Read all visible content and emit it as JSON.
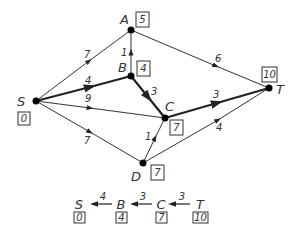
{
  "diagram": {
    "title": "",
    "colors": {
      "line": "#333333",
      "node": "#000000",
      "background": "#ffffff"
    },
    "nodes": [
      {
        "id": "S",
        "label": "S",
        "value": "0"
      },
      {
        "id": "A",
        "label": "A",
        "value": "5"
      },
      {
        "id": "B",
        "label": "B",
        "value": "4"
      },
      {
        "id": "C",
        "label": "C",
        "value": "7"
      },
      {
        "id": "D",
        "label": "D",
        "value": "7"
      },
      {
        "id": "T",
        "label": "T",
        "value": "10"
      }
    ],
    "edges": [
      {
        "from": "S",
        "to": "A",
        "weight": "7",
        "bold": false
      },
      {
        "from": "S",
        "to": "B",
        "weight": "4",
        "bold": true
      },
      {
        "from": "S",
        "to": "C",
        "weight": "9",
        "bold": false
      },
      {
        "from": "S",
        "to": "D",
        "weight": "7",
        "bold": false
      },
      {
        "from": "B",
        "to": "A",
        "weight": "1",
        "bold": false
      },
      {
        "from": "B",
        "to": "C",
        "weight": "3",
        "bold": true
      },
      {
        "from": "A",
        "to": "T",
        "weight": "6",
        "bold": false
      },
      {
        "from": "C",
        "to": "T",
        "weight": "3",
        "bold": true
      },
      {
        "from": "D",
        "to": "C",
        "weight": "1",
        "bold": false
      },
      {
        "from": "D",
        "to": "T",
        "weight": "4",
        "bold": false
      }
    ],
    "shortest_path": {
      "nodes": [
        {
          "label": "S",
          "value": "0"
        },
        {
          "label": "B",
          "value": "4"
        },
        {
          "label": "C",
          "value": "7"
        },
        {
          "label": "T",
          "value": "10"
        }
      ],
      "weights": [
        "4",
        "3",
        "3"
      ]
    }
  }
}
